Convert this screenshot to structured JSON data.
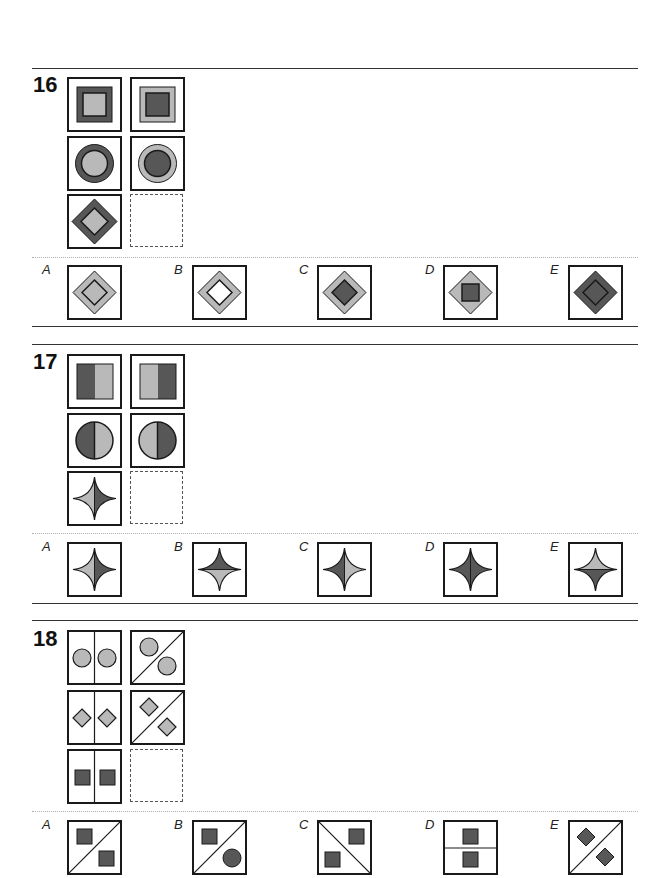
{
  "colors": {
    "dark": "#575757",
    "light": "#b9b9b9",
    "white": "#ffffff",
    "stroke": "#1a1a1a"
  },
  "questions": [
    {
      "number": "16",
      "grid": [
        [
          "square-dark-outer-light-inner",
          "square-light-outer-dark-inner"
        ],
        [
          "circle-dark-outer-light-inner",
          "circle-light-outer-dark-inner"
        ],
        [
          "diamond-dark-outer-light-inner",
          "missing"
        ]
      ],
      "options": [
        {
          "label": "A",
          "figure": "diamond-light-outer-light-inner"
        },
        {
          "label": "B",
          "figure": "diamond-light-outer-white-inner"
        },
        {
          "label": "C",
          "figure": "diamond-light-outer-dark-inner"
        },
        {
          "label": "D",
          "figure": "diamond-light-outer-dark-square-inner"
        },
        {
          "label": "E",
          "figure": "diamond-dark-outer-dark-inner"
        }
      ]
    },
    {
      "number": "17",
      "grid": [
        [
          "square-split-dark-left-light-right",
          "square-split-light-left-dark-right"
        ],
        [
          "circle-split-dark-left-light-right",
          "circle-split-light-left-dark-right"
        ],
        [
          "star-split-light-left-dark-right",
          "missing"
        ]
      ],
      "options": [
        {
          "label": "A",
          "figure": "star-split-light-left-dark-right"
        },
        {
          "label": "B",
          "figure": "star-split-dark-top-light-bottom"
        },
        {
          "label": "C",
          "figure": "star-split-dark-left-light-right"
        },
        {
          "label": "D",
          "figure": "star-split-dark-left-dark-right"
        },
        {
          "label": "E",
          "figure": "star-split-light-top-dark-bottom"
        }
      ]
    },
    {
      "number": "18",
      "grid": [
        [
          "vertical-divider-two-light-circles",
          "diagonal-divider-two-light-circles"
        ],
        [
          "vertical-divider-two-light-diamonds",
          "diagonal-divider-two-light-diamonds"
        ],
        [
          "vertical-divider-two-dark-squares",
          "missing"
        ]
      ],
      "options": [
        {
          "label": "A",
          "figure": "diagonal-divider-two-dark-squares"
        },
        {
          "label": "B",
          "figure": "diagonal-divider-dark-square-and-dark-circle"
        },
        {
          "label": "C",
          "figure": "anti-diagonal-divider-two-dark-squares"
        },
        {
          "label": "D",
          "figure": "horizontal-divider-two-dark-squares"
        },
        {
          "label": "E",
          "figure": "diagonal-divider-two-dark-diamonds"
        }
      ]
    }
  ]
}
